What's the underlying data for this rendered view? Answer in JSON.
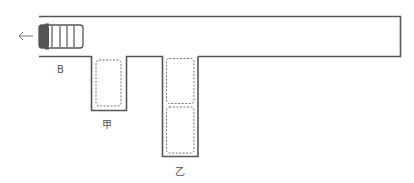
{
  "diagram": {
    "title": "",
    "direction_arrow": "←",
    "labels": {
      "entrance": "B",
      "slot_jia": "甲",
      "slot_yi": "乙"
    },
    "colors": {
      "line": "#555555",
      "dashed": "#777777",
      "car_body": "#555555"
    }
  }
}
